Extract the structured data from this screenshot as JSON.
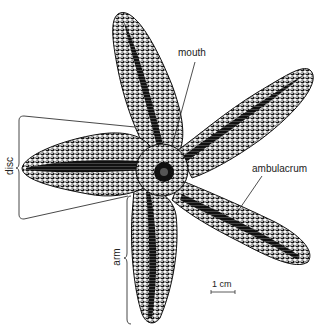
{
  "figure": {
    "labels": {
      "mouth": "mouth",
      "ambulacrum": "ambulacrum",
      "disc": "disc",
      "arm": "arm",
      "scale": "1 cm"
    }
  },
  "colors": {
    "ink": "#111111",
    "line": "#333333",
    "background": "#ffffff"
  }
}
